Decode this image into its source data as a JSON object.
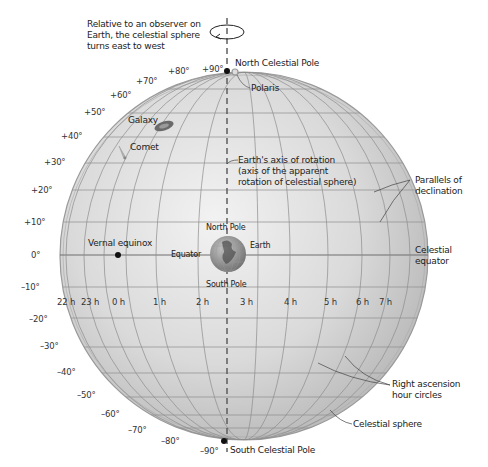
{
  "title": "Celestial sphere",
  "annotations": {
    "rotation_note": [
      "Relative to an observer on",
      "Earth, the celestial sphere",
      "turns east to west"
    ],
    "north_celestial_pole": "North Celestial Pole",
    "south_celestial_pole": "South Celestial Pole",
    "polaris": "Polaris",
    "galaxy": "Galaxy",
    "comet": "Comet",
    "earth_axis": [
      "Earth's axis of rotation",
      "(axis of the apparent",
      "rotation of celestial sphere)"
    ],
    "parallels": [
      "Parallels of",
      "declination"
    ],
    "celestial_equator": [
      "Celestial",
      "equator"
    ],
    "vernal_equinox": "Vernal equinox",
    "equator": "Equator",
    "earth": "Earth",
    "north_pole": "North Pole",
    "south_pole": "South Pole",
    "right_ascension": [
      "Right ascension",
      "hour circles"
    ],
    "celestial_sphere": "Celestial sphere"
  },
  "declination_labels": [
    "+90°",
    "+80°",
    "+70°",
    "+60°",
    "+50°",
    "+40°",
    "+30°",
    "+20°",
    "+10°",
    "0°",
    "–10°",
    "–20°",
    "–30°",
    "–40°",
    "–50°",
    "–60°",
    "–70°",
    "–80°",
    "–90°"
  ],
  "right_ascension_labels": [
    "22 h",
    "23 h",
    "0 h",
    "1 h",
    "2 h",
    "3 h",
    "4 h",
    "5 h",
    "6 h",
    "7 h"
  ],
  "colors": {
    "sphere_fill": "#d9d9d9",
    "sphere_edge": "#9a9a9a",
    "grid": "#8c8c8c",
    "axis": "#555555",
    "text": "#222222"
  }
}
